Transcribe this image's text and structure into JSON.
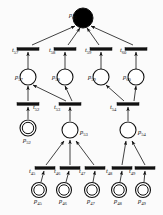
{
  "diagram": {
    "type": "petri-net",
    "title": "",
    "colors": {
      "stroke": "#111111",
      "fill_empty": "#ffffff",
      "fill_marked": "#000000",
      "background": "#fbfbfb"
    },
    "places": [
      {
        "id": "p62",
        "name": "p",
        "index": "62",
        "x": 83,
        "y": 18,
        "r": 10,
        "style": "filled",
        "label_pos": "left",
        "label_dx": -14,
        "label_dy": -3
      },
      {
        "id": "p57",
        "name": "p",
        "index": "57",
        "x": 28,
        "y": 77,
        "r": 8,
        "style": "single",
        "label_pos": "left",
        "label_dx": -13,
        "label_dy": 0
      },
      {
        "id": "p58",
        "name": "p",
        "index": "58",
        "x": 65,
        "y": 77,
        "r": 8,
        "style": "single",
        "label_pos": "left",
        "label_dx": -13,
        "label_dy": 0
      },
      {
        "id": "p59",
        "name": "p",
        "index": "59",
        "x": 101,
        "y": 77,
        "r": 8,
        "style": "single",
        "label_pos": "left",
        "label_dx": -13,
        "label_dy": 0
      },
      {
        "id": "p60",
        "name": "p",
        "index": "60",
        "x": 136,
        "y": 77,
        "r": 8,
        "style": "single",
        "label_pos": "left",
        "label_dx": -13,
        "label_dy": 0
      },
      {
        "id": "p52",
        "name": "p",
        "index": "52",
        "x": 28,
        "y": 128,
        "r": 8,
        "style": "double",
        "label_pos": "below",
        "label_dx": -5,
        "label_dy": 12
      },
      {
        "id": "p53",
        "name": "p",
        "index": "53",
        "x": 70,
        "y": 130,
        "r": 8,
        "style": "single",
        "label_pos": "right",
        "label_dx": 10,
        "label_dy": 2
      },
      {
        "id": "p54",
        "name": "p",
        "index": "54",
        "x": 128,
        "y": 130,
        "r": 8,
        "style": "single",
        "label_pos": "right",
        "label_dx": 10,
        "label_dy": 2
      },
      {
        "id": "p45",
        "name": "p",
        "index": "45",
        "x": 39,
        "y": 190,
        "r": 7.5,
        "style": "double",
        "label_pos": "below",
        "label_dx": -5,
        "label_dy": 11
      },
      {
        "id": "p46",
        "name": "p",
        "index": "46",
        "x": 64,
        "y": 190,
        "r": 7.5,
        "style": "double",
        "label_pos": "below",
        "label_dx": -5,
        "label_dy": 11
      },
      {
        "id": "p47",
        "name": "p",
        "index": "47",
        "x": 92,
        "y": 190,
        "r": 7.5,
        "style": "double",
        "label_pos": "below",
        "label_dx": -5,
        "label_dy": 11
      },
      {
        "id": "p48",
        "name": "p",
        "index": "48",
        "x": 119,
        "y": 190,
        "r": 7.5,
        "style": "double",
        "label_pos": "below",
        "label_dx": -5,
        "label_dy": 11
      },
      {
        "id": "p49",
        "name": "p",
        "index": "49",
        "x": 143,
        "y": 190,
        "r": 7.5,
        "style": "double",
        "label_pos": "below",
        "label_dx": -5,
        "label_dy": 11
      }
    ],
    "transitions": [
      {
        "id": "t57",
        "name": "t",
        "index": "57",
        "x": 28,
        "y": 49,
        "w": 22,
        "h": 2.6,
        "label_dx": -16,
        "label_dy": 1
      },
      {
        "id": "t58",
        "name": "t",
        "index": "58",
        "x": 65,
        "y": 49,
        "w": 22,
        "h": 2.6,
        "label_dx": -16,
        "label_dy": 1
      },
      {
        "id": "t59",
        "name": "t",
        "index": "59",
        "x": 101,
        "y": 49,
        "w": 22,
        "h": 2.6,
        "label_dx": -16,
        "label_dy": 1
      },
      {
        "id": "t60",
        "name": "t",
        "index": "60",
        "x": 136,
        "y": 49,
        "w": 22,
        "h": 2.6,
        "label_dx": -16,
        "label_dy": 1
      },
      {
        "id": "t52",
        "name": "t",
        "index": "52",
        "x": 28,
        "y": 104,
        "w": 22,
        "h": 2.6,
        "label_dx": 5,
        "label_dy": 3
      },
      {
        "id": "t53",
        "name": "t",
        "index": "53",
        "x": 70,
        "y": 104,
        "w": 22,
        "h": 2.6,
        "label_dx": -16,
        "label_dy": 3
      },
      {
        "id": "t54",
        "name": "t",
        "index": "54",
        "x": 128,
        "y": 104,
        "w": 22,
        "h": 2.6,
        "label_dx": -18,
        "label_dy": 3
      },
      {
        "id": "t45",
        "name": "t",
        "index": "45",
        "x": 45,
        "y": 168,
        "w": 20,
        "h": 2.6,
        "label_dx": -16,
        "label_dy": 3
      },
      {
        "id": "t46",
        "name": "t",
        "index": "46",
        "x": 70,
        "y": 168,
        "w": 20,
        "h": 2.6,
        "label_dx": -16,
        "label_dy": 3
      },
      {
        "id": "t47",
        "name": "t",
        "index": "47",
        "x": 95,
        "y": 168,
        "w": 20,
        "h": 2.6,
        "label_dx": -16,
        "label_dy": 3
      },
      {
        "id": "t48",
        "name": "t",
        "index": "48",
        "x": 122,
        "y": 168,
        "w": 20,
        "h": 2.6,
        "label_dx": -16,
        "label_dy": 3
      },
      {
        "id": "t49",
        "name": "t",
        "index": "49",
        "x": 145,
        "y": 168,
        "w": 20,
        "h": 2.6,
        "label_dx": -16,
        "label_dy": 3
      }
    ],
    "arcs": [
      {
        "id": "a-t57-p62",
        "from": "t57",
        "to": "p62",
        "x1": 32,
        "y1": 45,
        "x2": 75,
        "y2": 26
      },
      {
        "id": "a-t58-p62",
        "from": "t58",
        "to": "p62",
        "x1": 68,
        "y1": 45,
        "x2": 80,
        "y2": 28
      },
      {
        "id": "a-t59-p62",
        "from": "t59",
        "to": "p62",
        "x1": 99,
        "y1": 45,
        "x2": 87,
        "y2": 28
      },
      {
        "id": "a-t60-p62",
        "from": "t60",
        "to": "p62",
        "x1": 133,
        "y1": 45,
        "x2": 91,
        "y2": 26
      },
      {
        "id": "a-p57-t57",
        "from": "p57",
        "to": "t57",
        "x1": 28,
        "y1": 69,
        "x2": 28,
        "y2": 52
      },
      {
        "id": "a-p58-t58",
        "from": "p58",
        "to": "t58",
        "x1": 65,
        "y1": 69,
        "x2": 65,
        "y2": 52
      },
      {
        "id": "a-p59-t59",
        "from": "p59",
        "to": "t59",
        "x1": 101,
        "y1": 69,
        "x2": 101,
        "y2": 52
      },
      {
        "id": "a-p60-t60",
        "from": "p60",
        "to": "t60",
        "x1": 136,
        "y1": 69,
        "x2": 136,
        "y2": 52
      },
      {
        "id": "a-t52-p57",
        "from": "t52",
        "to": "p57",
        "x1": 28,
        "y1": 101,
        "x2": 28,
        "y2": 86
      },
      {
        "id": "a-t53-p57",
        "from": "t53",
        "to": "p57",
        "x1": 66,
        "y1": 101,
        "x2": 33,
        "y2": 85
      },
      {
        "id": "a-t53-p58",
        "from": "t53",
        "to": "p58",
        "x1": 72,
        "y1": 101,
        "x2": 65,
        "y2": 86
      },
      {
        "id": "a-t54-p59",
        "from": "t54",
        "to": "p59",
        "x1": 124,
        "y1": 101,
        "x2": 106,
        "y2": 85
      },
      {
        "id": "a-t54-p60",
        "from": "t54",
        "to": "p60",
        "x1": 134,
        "y1": 101,
        "x2": 136,
        "y2": 86
      },
      {
        "id": "a-p52-t52",
        "from": "p52",
        "to": "t52",
        "x1": 28,
        "y1": 119,
        "x2": 28,
        "y2": 107
      },
      {
        "id": "a-p53-t53",
        "from": "p53",
        "to": "t53",
        "x1": 70,
        "y1": 121,
        "x2": 70,
        "y2": 107
      },
      {
        "id": "a-p54-t54",
        "from": "p54",
        "to": "t54",
        "x1": 128,
        "y1": 121,
        "x2": 128,
        "y2": 107
      },
      {
        "id": "a-t45-p53",
        "from": "t45",
        "to": "p53",
        "x1": 46,
        "y1": 165,
        "x2": 64,
        "y2": 141
      },
      {
        "id": "a-t46-p53",
        "from": "t46",
        "to": "p53",
        "x1": 70,
        "y1": 165,
        "x2": 70,
        "y2": 140
      },
      {
        "id": "a-t47-p53",
        "from": "t47",
        "to": "p53",
        "x1": 94,
        "y1": 165,
        "x2": 76,
        "y2": 141
      },
      {
        "id": "a-t48-p54",
        "from": "t48",
        "to": "p54",
        "x1": 122,
        "y1": 165,
        "x2": 126,
        "y2": 141
      },
      {
        "id": "a-t49-p54",
        "from": "t49",
        "to": "p54",
        "x1": 145,
        "y1": 165,
        "x2": 132,
        "y2": 141
      },
      {
        "id": "a-p45-t45",
        "from": "p45",
        "to": "t45",
        "x1": 41,
        "y1": 182,
        "x2": 44,
        "y2": 171
      },
      {
        "id": "a-p46-t46",
        "from": "p46",
        "to": "t46",
        "x1": 66,
        "y1": 182,
        "x2": 69,
        "y2": 171
      },
      {
        "id": "a-p47-t47",
        "from": "p47",
        "to": "t47",
        "x1": 93,
        "y1": 182,
        "x2": 95,
        "y2": 171
      },
      {
        "id": "a-p48-t48",
        "from": "p48",
        "to": "t48",
        "x1": 120,
        "y1": 182,
        "x2": 122,
        "y2": 171
      },
      {
        "id": "a-p49-t49",
        "from": "p49",
        "to": "t49",
        "x1": 144,
        "y1": 182,
        "x2": 145,
        "y2": 171
      }
    ]
  }
}
